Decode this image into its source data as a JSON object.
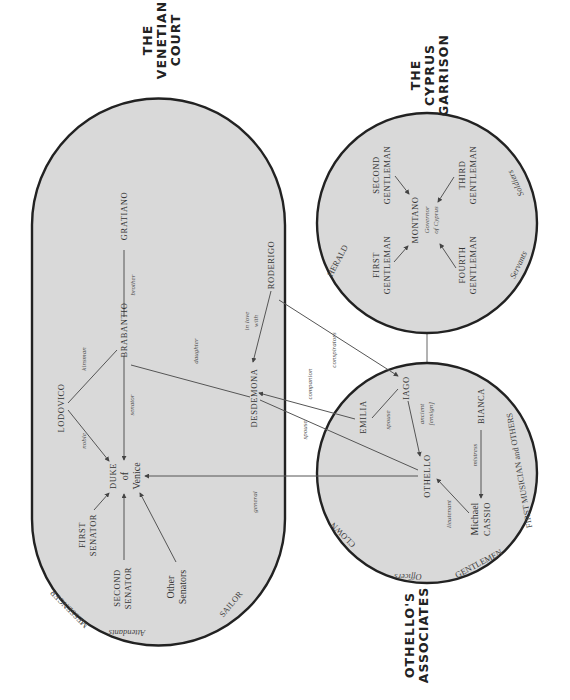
{
  "groups": {
    "venetian_court": {
      "title_lines": [
        "THE",
        "VENETIAN",
        "COURT"
      ]
    },
    "cyprus_garrison": {
      "title_lines": [
        "THE",
        "CYPRUS",
        "GARRISON"
      ]
    },
    "othellos_associates": {
      "title_lines": [
        "OTHELLO'S",
        "ASSOCIATES"
      ]
    }
  },
  "characters": {
    "gratiano": "GRATIANO",
    "brabantio": "BRABANTIO",
    "roderigo": "RODERIGO",
    "lodovico": "LODOVICO",
    "desdemona": "DESDEMONA",
    "duke": [
      "DUKE",
      "of",
      "Venice"
    ],
    "first_senator": [
      "FIRST",
      "SENATOR"
    ],
    "second_senator": [
      "SECOND",
      "SENATOR"
    ],
    "other_senators": [
      "Other",
      "Senators"
    ],
    "montano": "MONTANO",
    "montano_title": [
      "Governor",
      "of Cyprus"
    ],
    "first_gentleman": [
      "FIRST",
      "GENTLEMAN"
    ],
    "second_gentleman": [
      "SECOND",
      "GENTLEMAN"
    ],
    "third_gentleman": [
      "THIRD",
      "GENTLEMAN"
    ],
    "fourth_gentleman": [
      "FOURTH",
      "GENTLEMAN"
    ],
    "iago": "IAGO",
    "emilia": "EMILIA",
    "othello": "OTHELLO",
    "bianca": "BIANCA",
    "cassio": [
      "Michael",
      "CASSIO"
    ]
  },
  "minor_roles": {
    "messenger": "MESSENGER",
    "attendants": "Attendants",
    "sailor": "SAILOR",
    "herald": "HERALD",
    "soldiers": "Soldiers",
    "servants": "Servants",
    "clown": "CLOWN",
    "officers": "Officers",
    "gentlemen": "GENTLEMEN",
    "first_musician": "FIRST MUSICIAN and OTHERS"
  },
  "relationships": {
    "brother": "brother",
    "kinsman": "kinsman",
    "noble": "noble",
    "senator": "senator",
    "daughter": "daughter",
    "in_love_with": [
      "in love",
      "with"
    ],
    "general": "general",
    "conspirators": "conspirators",
    "companion": "companion",
    "spouse_othello": "spouse",
    "spouse_iago": "spouse",
    "ancient": [
      "ancient",
      "[ensign]"
    ],
    "lieutenant": "lieutenant",
    "mistress": "mistress"
  }
}
